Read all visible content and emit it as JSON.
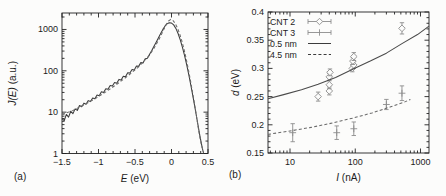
{
  "figure": {
    "panel_a_label": "(a)",
    "panel_b_label": "(b)"
  },
  "colors": {
    "axis": "#222222",
    "text": "#1c1c1c",
    "solid_curve": "#3b3b3b",
    "dashed_curve": "#6a6a6a",
    "marker_gray": "#8c8c8c",
    "background": "#fcfcfb"
  },
  "chart_data": [
    {
      "id": "a",
      "type": "line",
      "panel": "(a)",
      "xlabel": {
        "var": "E",
        "unit": " (eV)"
      },
      "ylabel": {
        "var": "J(E)",
        "unit": " (a.u.)"
      },
      "xlim": [
        -1.5,
        0.5
      ],
      "xlog": false,
      "x_minor_step": 0.1,
      "ylim": [
        1,
        2500
      ],
      "ylog": true,
      "grid": false,
      "x_ticks": [
        {
          "v": -1.5,
          "label": "−1.5"
        },
        {
          "v": -1.0,
          "label": "−1"
        },
        {
          "v": -0.5,
          "label": "−0.5"
        },
        {
          "v": 0.0,
          "label": "0"
        },
        {
          "v": 0.5,
          "label": "0.5"
        }
      ],
      "y_ticks": [
        {
          "v": 1,
          "label": "1"
        },
        {
          "v": 10,
          "label": "10"
        },
        {
          "v": 100,
          "label": "100"
        },
        {
          "v": 1000,
          "label": "1000"
        }
      ],
      "series": [
        {
          "name": "measured spectrum",
          "kind": "line",
          "style": "solid",
          "color": "#3b3b3b",
          "points": [
            [
              -1.5,
              7
            ],
            [
              -1.47,
              6.2
            ],
            [
              -1.44,
              8.8
            ],
            [
              -1.41,
              7.6
            ],
            [
              -1.38,
              10.5
            ],
            [
              -1.35,
              9.2
            ],
            [
              -1.32,
              12
            ],
            [
              -1.29,
              11
            ],
            [
              -1.26,
              14.5
            ],
            [
              -1.23,
              13.5
            ],
            [
              -1.2,
              16.5
            ],
            [
              -1.17,
              15.5
            ],
            [
              -1.14,
              19
            ],
            [
              -1.11,
              18
            ],
            [
              -1.08,
              22
            ],
            [
              -1.05,
              21
            ],
            [
              -1.02,
              26
            ],
            [
              -0.99,
              25
            ],
            [
              -0.96,
              31
            ],
            [
              -0.93,
              30
            ],
            [
              -0.9,
              37
            ],
            [
              -0.87,
              36
            ],
            [
              -0.84,
              44
            ],
            [
              -0.81,
              43
            ],
            [
              -0.78,
              52
            ],
            [
              -0.75,
              50
            ],
            [
              -0.72,
              62
            ],
            [
              -0.69,
              60
            ],
            [
              -0.66,
              74
            ],
            [
              -0.63,
              72
            ],
            [
              -0.6,
              90
            ],
            [
              -0.57,
              88
            ],
            [
              -0.54,
              108
            ],
            [
              -0.51,
              105
            ],
            [
              -0.48,
              130
            ],
            [
              -0.45,
              128
            ],
            [
              -0.42,
              158
            ],
            [
              -0.39,
              155
            ],
            [
              -0.36,
              195
            ],
            [
              -0.33,
              200
            ],
            [
              -0.3,
              250
            ],
            [
              -0.27,
              310
            ],
            [
              -0.24,
              390
            ],
            [
              -0.21,
              490
            ],
            [
              -0.18,
              620
            ],
            [
              -0.15,
              790
            ],
            [
              -0.12,
              990
            ],
            [
              -0.09,
              1200
            ],
            [
              -0.06,
              1380
            ],
            [
              -0.03,
              1460
            ],
            [
              0,
              1430
            ],
            [
              0.03,
              1290
            ],
            [
              0.06,
              1060
            ],
            [
              0.09,
              800
            ],
            [
              0.12,
              560
            ],
            [
              0.15,
              370
            ],
            [
              0.18,
              230
            ],
            [
              0.21,
              135
            ],
            [
              0.24,
              75
            ],
            [
              0.27,
              40
            ],
            [
              0.3,
              21
            ],
            [
              0.33,
              10.5
            ],
            [
              0.36,
              5.2
            ],
            [
              0.39,
              2.6
            ],
            [
              0.42,
              1.4
            ],
            [
              0.44,
              1.0
            ]
          ]
        },
        {
          "name": "fit spectrum",
          "kind": "line",
          "style": "dashed",
          "color": "#6a6a6a",
          "points": [
            [
              -1.5,
              8.8
            ],
            [
              -1.35,
              11
            ],
            [
              -1.2,
              15
            ],
            [
              -1.05,
              21
            ],
            [
              -0.9,
              31
            ],
            [
              -0.75,
              47
            ],
            [
              -0.6,
              75
            ],
            [
              -0.45,
              125
            ],
            [
              -0.3,
              240
            ],
            [
              -0.24,
              350
            ],
            [
              -0.18,
              540
            ],
            [
              -0.12,
              880
            ],
            [
              -0.08,
              1250
            ],
            [
              -0.04,
              1600
            ],
            [
              -0.01,
              1750
            ],
            [
              0.02,
              1650
            ],
            [
              0.05,
              1400
            ],
            [
              0.08,
              1100
            ],
            [
              0.11,
              800
            ],
            [
              0.14,
              540
            ],
            [
              0.17,
              340
            ],
            [
              0.2,
              200
            ],
            [
              0.23,
              110
            ],
            [
              0.26,
              58
            ],
            [
              0.29,
              29
            ],
            [
              0.32,
              14
            ],
            [
              0.35,
              6.5
            ],
            [
              0.38,
              3
            ],
            [
              0.41,
              1.6
            ],
            [
              0.44,
              1.05
            ]
          ]
        }
      ]
    },
    {
      "id": "b",
      "type": "scatter",
      "panel": "(b)",
      "xlabel": {
        "var": "I",
        "unit": " (nA)"
      },
      "ylabel": {
        "var": "d",
        "unit": " (eV)"
      },
      "xlim": [
        4.6,
        1350
      ],
      "xlog": true,
      "ylim": [
        0.15,
        0.4
      ],
      "ylog": false,
      "y_minor_step": 0.01,
      "grid": false,
      "x_ticks": [
        {
          "v": 10,
          "label": "10"
        },
        {
          "v": 100,
          "label": "100"
        },
        {
          "v": 1000,
          "label": "1000"
        }
      ],
      "y_ticks": [
        {
          "v": 0.15,
          "label": "0.15"
        },
        {
          "v": 0.2,
          "label": "0.2"
        },
        {
          "v": 0.25,
          "label": "0.25"
        },
        {
          "v": 0.3,
          "label": "0.3"
        },
        {
          "v": 0.35,
          "label": "0.35"
        },
        {
          "v": 0.4,
          "label": "0.4"
        }
      ],
      "legend": [
        {
          "label": "CNT 2",
          "symbol": "diamond"
        },
        {
          "label": "CNT 3",
          "symbol": "plus"
        },
        {
          "label": "0.5 nm",
          "symbol": "solid-line"
        },
        {
          "label": "4.5 nm",
          "symbol": "dashed-line"
        }
      ],
      "series": [
        {
          "name": "CNT 2",
          "kind": "scatter",
          "marker": "diamond",
          "color": "#8c8c8c",
          "points": [
            {
              "x": 27,
              "y": 0.25,
              "err": 0.008
            },
            {
              "x": 40,
              "y": 0.26,
              "err": 0.007
            },
            {
              "x": 40,
              "y": 0.271,
              "err": 0.007
            },
            {
              "x": 40,
              "y": 0.285,
              "err": 0.006
            },
            {
              "x": 41,
              "y": 0.293,
              "err": 0.006
            },
            {
              "x": 90,
              "y": 0.3,
              "err": 0.006
            },
            {
              "x": 95,
              "y": 0.306,
              "err": 0.006
            },
            {
              "x": 92,
              "y": 0.313,
              "err": 0.006
            },
            {
              "x": 95,
              "y": 0.321,
              "err": 0.007
            },
            {
              "x": 520,
              "y": 0.371,
              "err": 0.01
            }
          ]
        },
        {
          "name": "CNT 3",
          "kind": "scatter",
          "marker": "plus",
          "color": "#8c8c8c",
          "points": [
            {
              "x": 11,
              "y": 0.186,
              "err": 0.016
            },
            {
              "x": 52,
              "y": 0.186,
              "err": 0.012
            },
            {
              "x": 95,
              "y": 0.193,
              "err": 0.012
            },
            {
              "x": 300,
              "y": 0.236,
              "err": 0.009
            },
            {
              "x": 520,
              "y": 0.256,
              "err": 0.013
            }
          ]
        },
        {
          "name": "0.5 nm",
          "kind": "line",
          "style": "solid",
          "color": "#4a4a4a",
          "points": [
            [
              4.6,
              0.246
            ],
            [
              8,
              0.2535
            ],
            [
              15,
              0.262
            ],
            [
              27,
              0.272
            ],
            [
              50,
              0.284
            ],
            [
              93,
              0.299
            ],
            [
              170,
              0.313
            ],
            [
              300,
              0.327
            ],
            [
              520,
              0.344
            ],
            [
              900,
              0.36
            ],
            [
              1350,
              0.375
            ]
          ]
        },
        {
          "name": "4.5 nm",
          "kind": "line",
          "style": "dashed",
          "color": "#6a6a6a",
          "points": [
            [
              4.6,
              0.183
            ],
            [
              10,
              0.189
            ],
            [
              20,
              0.195
            ],
            [
              40,
              0.202
            ],
            [
              93,
              0.212
            ],
            [
              180,
              0.221
            ],
            [
              350,
              0.232
            ],
            [
              560,
              0.24
            ],
            [
              700,
              0.245
            ]
          ]
        }
      ]
    }
  ]
}
